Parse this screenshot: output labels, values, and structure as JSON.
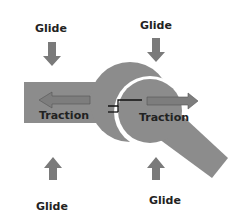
{
  "diagram": {
    "colors": {
      "shape": "#8c8c8c",
      "arrow": "#7a7a7a",
      "text": "#222222",
      "line": "#111111",
      "background": "#ffffff"
    },
    "labels": {
      "glide_top_left": "Glide",
      "glide_top_right": "Glide",
      "glide_bottom_left": "Glide",
      "glide_bottom_right": "Glide",
      "traction_left": "Traction",
      "traction_right": "Traction"
    }
  }
}
